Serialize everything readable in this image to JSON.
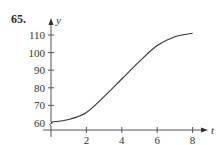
{
  "problem_number": "65.",
  "chart_data": {
    "type": "line",
    "title": "",
    "xlabel": "t",
    "ylabel": "y",
    "x_ticks": [
      2,
      4,
      6,
      8
    ],
    "x_tick_labels": [
      "2",
      "4",
      "6",
      "8"
    ],
    "y_ticks": [
      60,
      70,
      80,
      90,
      100,
      110
    ],
    "y_tick_labels": [
      "60",
      "70",
      "80",
      "90",
      "100",
      "110"
    ],
    "xlim": [
      0,
      8.8
    ],
    "ylim": [
      56,
      116
    ],
    "y_axis_break": true,
    "grid": false,
    "legend": "none",
    "series": [
      {
        "name": "y(t)",
        "x": [
          0,
          1,
          2,
          3,
          4,
          5,
          6,
          7,
          8
        ],
        "y": [
          60.5,
          62,
          66,
          75,
          85,
          95,
          104,
          109,
          111
        ]
      }
    ],
    "colors": {
      "axis": "#555555",
      "curve": "#333333"
    }
  }
}
